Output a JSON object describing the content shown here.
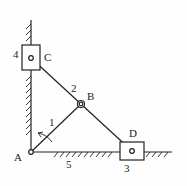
{
  "diagram": {
    "labels": {
      "A": "A",
      "B": "B",
      "C": "C",
      "D": "D",
      "link1": "1",
      "link2": "2",
      "link3": "3",
      "link4": "4",
      "link5": "5"
    },
    "colors": {
      "ink": "#222222",
      "background": "#fefefe"
    }
  }
}
